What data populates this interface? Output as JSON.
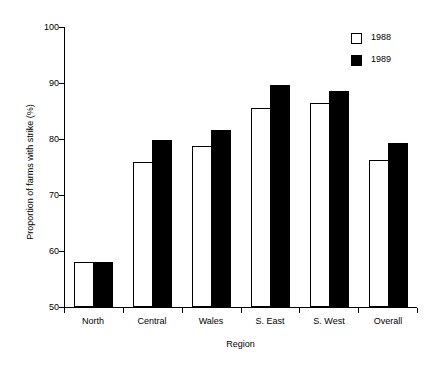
{
  "chart_data": {
    "type": "bar",
    "title": "",
    "xlabel": "Region",
    "ylabel": "Proportion of farms with strike (%)",
    "categories": [
      "North",
      "Central",
      "Wales",
      "S. East",
      "S. West",
      "Overall"
    ],
    "series": [
      {
        "name": "1988",
        "style": "open",
        "values": [
          58.0,
          75.9,
          78.7,
          85.5,
          86.5,
          76.3
        ]
      },
      {
        "name": "1989",
        "style": "filled",
        "values": [
          58.0,
          79.8,
          81.6,
          89.7,
          88.5,
          79.3
        ]
      }
    ],
    "ylim": [
      50,
      100
    ],
    "yticks": [
      50,
      60,
      70,
      80,
      90,
      100
    ],
    "ytick_labels": [
      "50",
      "60",
      "70",
      "80",
      "90",
      "100"
    ],
    "grid": false,
    "legend_position": "top-right",
    "colors": {
      "open": "#ffffff",
      "filled": "#000000",
      "axis": "#000000"
    }
  }
}
